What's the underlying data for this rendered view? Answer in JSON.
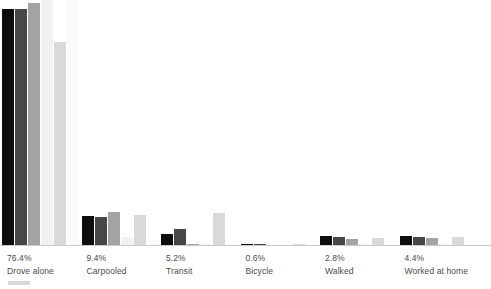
{
  "chart_data": {
    "type": "bar",
    "title": "",
    "subtitle": "",
    "xlabel": "",
    "ylabel": "",
    "grid": false,
    "legend_position": "bottom-left",
    "orientation": "vertical",
    "grouping": "grouped",
    "ylim": [
      0,
      80
    ],
    "categories": [
      "Drove alone",
      "Carpooled",
      "Transit",
      "Bicycle",
      "Walked",
      "Worked at home"
    ],
    "category_values": [
      76.4,
      9.4,
      5.2,
      0.6,
      2.8,
      4.4
    ],
    "category_value_labels": [
      "76.4%",
      "9.4%",
      "5.2%",
      "0.6%",
      "2.8%",
      "4.4%"
    ],
    "series": [
      {
        "name": "series-1",
        "color": "#0d0d0d",
        "values": [
          77.0,
          9.8,
          4.0,
          0.6,
          3.4,
          3.4
        ]
      },
      {
        "name": "series-2",
        "color": "#474747",
        "values": [
          77.0,
          9.4,
          5.6,
          0.6,
          3.0,
          3.0
        ]
      },
      {
        "name": "series-3",
        "color": "#a3a3a3",
        "values": [
          79.0,
          11.0,
          0.8,
          0.4,
          2.4,
          2.6
        ]
      },
      {
        "name": "series-4",
        "color": "#f2f2f2",
        "values": [
          80.0,
          3.0,
          0.5,
          0.3,
          0.5,
          0.5
        ]
      },
      {
        "name": "series-5",
        "color": "#d9d9d9",
        "values": [
          66.5,
          10.2,
          10.8,
          0.5,
          2.6,
          3.0
        ]
      },
      {
        "name": "series-6",
        "color": "#fafafa",
        "values": [
          80.0,
          2.0,
          0.4,
          0.3,
          0.4,
          0.4
        ]
      }
    ],
    "legend_entries": [
      {
        "label": "",
        "color": "#d8d8d8"
      }
    ],
    "axis_line_color": "#c9c9c9",
    "background_color": "#ffffff",
    "label_color": "#4a4a4a"
  }
}
